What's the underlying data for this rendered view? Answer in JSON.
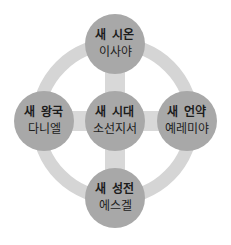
{
  "colors": {
    "node_fill": "#a8a8a8",
    "ring": "#d5d5d5",
    "connector": "#d8d8d8",
    "text": "#1c1c1c"
  },
  "nodes": {
    "top": {
      "line1": "새 시온",
      "line2": "이사야"
    },
    "center": {
      "line1": "새 시대",
      "line2": "소선지서"
    },
    "left": {
      "line1": "새 왕국",
      "line2": "다니엘"
    },
    "right": {
      "line1": "새 언약",
      "line2": "예레미야"
    },
    "bottom": {
      "line1": "새 성전",
      "line2": "에스겔"
    }
  }
}
